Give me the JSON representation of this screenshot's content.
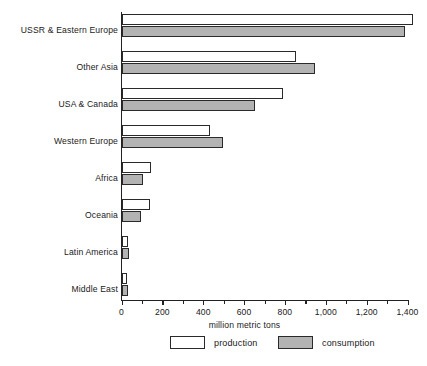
{
  "chart_data": {
    "type": "bar",
    "orientation": "horizontal",
    "title": "",
    "subtitle": "",
    "xlabel": "million metric tons",
    "ylabel": "",
    "xlim": [
      0,
      1500
    ],
    "grid": false,
    "legend_position": "bottom",
    "categories": [
      "USSR & Eastern Europe",
      "Other Asia",
      "USA & Canada",
      "Western Europe",
      "Africa",
      "Oceania",
      "Latin America",
      "Middle East"
    ],
    "series": [
      {
        "name": "production",
        "color": "#ffffff",
        "values": [
          1425,
          855,
          790,
          435,
          145,
          140,
          30,
          25
        ]
      },
      {
        "name": "consumption",
        "color": "#b3b3b3",
        "values": [
          1390,
          945,
          655,
          495,
          105,
          95,
          35,
          30
        ]
      }
    ],
    "xticks": [
      0,
      200,
      400,
      600,
      800,
      1000,
      1200,
      1400
    ],
    "xtick_labels": [
      "0",
      "200",
      "400",
      "600",
      "800",
      "1,000",
      "1,200",
      "1,400"
    ]
  },
  "legend": {
    "items": [
      {
        "label": "production",
        "swatch": "white-rectangle-swatch"
      },
      {
        "label": "consumption",
        "swatch": "gray-rectangle-swatch"
      }
    ]
  }
}
